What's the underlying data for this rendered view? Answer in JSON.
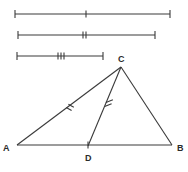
{
  "figure": {
    "background_color": "#ffffff",
    "line_color": "#3a3a3a",
    "label_color": "#2b2b2b"
  },
  "reference_segments": [
    {
      "name": "segment-one",
      "tick_count": 1,
      "tick_label": "single tick",
      "x1": 15,
      "y1": 14,
      "x2": 170,
      "y2": 14,
      "tick_x": 86
    },
    {
      "name": "segment-two",
      "tick_count": 2,
      "tick_label": "double tick",
      "x1": 18,
      "y1": 35,
      "x2": 155,
      "y2": 35,
      "tick_x": 85
    },
    {
      "name": "segment-three",
      "tick_count": 3,
      "tick_label": "triple tick",
      "x1": 17,
      "y1": 56,
      "x2": 103,
      "y2": 56,
      "tick_x": 61
    }
  ],
  "triangle": {
    "vertices": [
      {
        "id": "A",
        "label": "A",
        "x": 17,
        "y": 145,
        "label_x": 5,
        "label_y": 150
      },
      {
        "id": "B",
        "label": "B",
        "x": 172,
        "y": 145,
        "label_x": 176,
        "label_y": 150
      },
      {
        "id": "C",
        "label": "C",
        "x": 121,
        "y": 67,
        "label_x": 117,
        "label_y": 61
      },
      {
        "id": "D",
        "label": "D",
        "x": 88,
        "y": 146,
        "label_x": 85,
        "label_y": 160
      }
    ],
    "edges": [
      {
        "name": "side-AB",
        "from": "A",
        "to": "B",
        "tick_count": 0
      },
      {
        "name": "side-AC",
        "from": "A",
        "to": "C",
        "tick_count": 2
      },
      {
        "name": "side-CB",
        "from": "C",
        "to": "B",
        "tick_count": 0
      },
      {
        "name": "cevian-CD",
        "from": "C",
        "to": "D",
        "tick_count": 2
      }
    ],
    "segment_marks": [
      {
        "name": "mark-on-AD",
        "on_edge": "side-AB",
        "tick_count": 1,
        "x": 88,
        "y": 145
      },
      {
        "name": "mark-on-AC",
        "on_edge": "side-AC",
        "tick_count": 2,
        "x": 70,
        "y": 107
      },
      {
        "name": "mark-on-CD",
        "on_edge": "cevian-CD",
        "tick_count": 2,
        "x": 108,
        "y": 105
      }
    ]
  }
}
